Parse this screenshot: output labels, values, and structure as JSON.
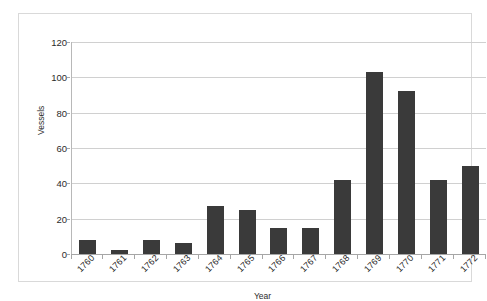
{
  "chart_data": {
    "type": "bar",
    "title": "",
    "xlabel": "Year",
    "ylabel": "Vessels",
    "categories": [
      "1760",
      "1761",
      "1762",
      "1763",
      "1764",
      "1765",
      "1766",
      "1767",
      "1768",
      "1769",
      "1770",
      "1771",
      "1772"
    ],
    "values": [
      8,
      2,
      8,
      6,
      27,
      25,
      15,
      15,
      42,
      103,
      92,
      42,
      50
    ],
    "ylim": [
      0,
      120
    ],
    "yticks": [
      0,
      20,
      40,
      60,
      80,
      100,
      120
    ],
    "ytick_labels": [
      "0",
      "20",
      "40",
      "60",
      "80",
      "100",
      "120"
    ],
    "grid": true,
    "legend": false,
    "series": [
      {
        "name": "Vessels",
        "values": [
          8,
          2,
          8,
          6,
          27,
          25,
          15,
          15,
          42,
          103,
          92,
          42,
          50
        ],
        "color": "#3a3a3a"
      }
    ]
  },
  "colors": {
    "bar": "#3a3a3a",
    "gridline": "#d0d0d0",
    "axis": "#a6a6a6",
    "frame": "#d9d9d9",
    "background": "#ffffff",
    "text": "#2b2b2b"
  }
}
